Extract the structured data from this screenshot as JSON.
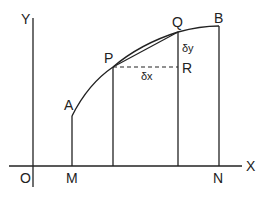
{
  "diagram": {
    "type": "geometry-figure",
    "colors": {
      "stroke": "#222222",
      "background": "#ffffff"
    },
    "axes": {
      "x_label": "X",
      "y_label": "Y",
      "origin_label": "O"
    },
    "points": {
      "A": "A",
      "P": "P",
      "Q": "Q",
      "B": "B",
      "R": "R",
      "M": "M",
      "N": "N"
    },
    "increments": {
      "dx": "δx",
      "dy": "δy"
    }
  }
}
